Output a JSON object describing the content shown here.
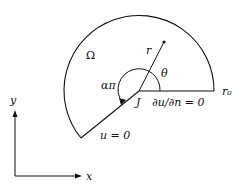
{
  "diagram": {
    "domain_label": "Ω",
    "radius_label": "r",
    "angle_label": "θ",
    "reentrant_angle_label": "απ",
    "corner_label": "J",
    "neumann_label": "∂u/∂n = 0",
    "dirichlet_label": "u = 0",
    "outer_radius_label": "r₀",
    "axis_x_label": "x",
    "axis_y_label": "y"
  },
  "colors": {
    "stroke": "#111111",
    "background": "#ffffff"
  }
}
